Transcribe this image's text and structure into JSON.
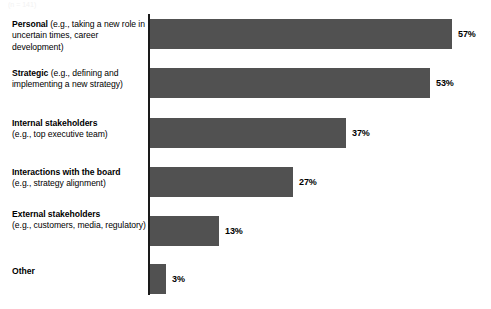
{
  "top_remnant": "(n = 141)",
  "chart_data": {
    "type": "bar",
    "orientation": "horizontal",
    "title": "",
    "subtitle": "",
    "xlabel": "",
    "ylabel": "",
    "xlim": [
      0,
      60
    ],
    "grid": false,
    "legend": false,
    "bar_color": "#515151",
    "axis_color": "#1a1a1a",
    "background_color": "#ffffff",
    "value_suffix": "%",
    "categories": [
      "Personal (e.g., taking a new role in uncertain times, career development)",
      "Strategic (e.g., defining and implementing a new strategy)",
      "Internal stakeholders (e.g., top executive team)",
      "Interactions with the board (e.g., strategy alignment)",
      "External stakeholders (e.g., customers, media, regulatory)",
      "Other"
    ],
    "values": [
      57,
      53,
      37,
      27,
      13,
      3
    ],
    "value_labels": [
      "57%",
      "53%",
      "37%",
      "27%",
      "13%",
      "3%"
    ],
    "category_parts": [
      {
        "lead": "Personal",
        "detail": " (e.g., taking a new role in uncertain times, career development)"
      },
      {
        "lead": "Strategic",
        "detail": " (e.g., defining and implementing a new strategy)"
      },
      {
        "lead": "Internal stakeholders",
        "detail": "(e.g., top executive team)"
      },
      {
        "lead": "Interactions with the board",
        "detail": "(e.g., strategy alignment)"
      },
      {
        "lead": "External stakeholders",
        "detail": "(e.g., customers, media, regulatory)"
      },
      {
        "lead": "Other",
        "detail": ""
      }
    ]
  }
}
